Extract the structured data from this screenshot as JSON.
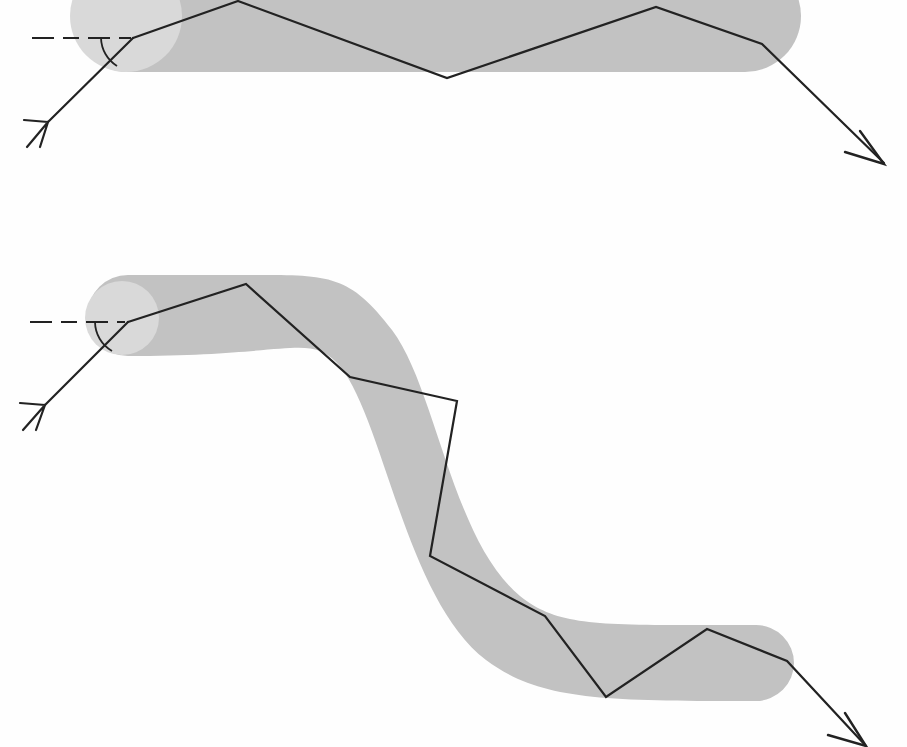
{
  "document": {
    "kind": "technical-diagram",
    "title": "",
    "canvas": {
      "width": 907,
      "height": 747,
      "background": "#fefefe"
    }
  },
  "style": {
    "band_fill": "#c2c2c2",
    "bulb_fill": "#d9d9d9",
    "path_stroke": "#222222",
    "reference_stroke": "#222222",
    "arc_stroke": "#222222",
    "path_stroke_width": 2.2,
    "reference_stroke_width": 2.0,
    "reference_dash": "22 9 16 9 22 9",
    "arc_stroke_width": 1.8
  },
  "figures": [
    {
      "id": "upper-figure",
      "name": "straight-channel-figure",
      "label": "",
      "band": {
        "name": "straight-band",
        "shape": "rounded-straight-band",
        "d": "M 128,-40 L 745,-40 A 56 56 0 0 1 745,72 L 128,72 A 56 56 0 0 1 128,-40 Z",
        "fill": "#c2c2c2"
      },
      "bulb": {
        "name": "entry-bulb",
        "shape": "circle",
        "cx": 126,
        "cy": 16,
        "r": 56,
        "fill": "#d9d9d9"
      },
      "reference_line": {
        "name": "horizontal-reference-line",
        "d": "M 32,38 L 131,38",
        "dash": "22 9 16 9 22 9"
      },
      "angle_arc": {
        "name": "incidence-angle-arc",
        "d": "M 101,38 A 34 34 0 0 0 117,66",
        "note": "arc between reference line and incoming ray"
      },
      "incoming_ray": {
        "name": "incoming-ray",
        "d": "M 48,122 L 133,38",
        "arrow": {
          "name": "tail-arrowhead",
          "style": "open-barb-tail",
          "d": "M 24,120 L 48,122 M 27,147 L 48,122 M 40,147 L 48,122",
          "tip": [
            48,
            122
          ]
        }
      },
      "ray_path": {
        "name": "ray-polyline",
        "points": [
          [
            133,
            38
          ],
          [
            238,
            1
          ],
          [
            447,
            78
          ],
          [
            656,
            7
          ],
          [
            762,
            44
          ],
          [
            884,
            163
          ]
        ],
        "d": "M 133,38 L 238,1 L 447,78 L 656,7 L 762,44 L 884,163"
      },
      "exit_arrow": {
        "name": "exit-arrowhead",
        "style": "closed-v",
        "d": "M 860,131 L 884,164 L 845,152",
        "tip": [
          884,
          164
        ]
      }
    },
    {
      "id": "lower-figure",
      "name": "s-bend-channel-figure",
      "label": "",
      "band": {
        "name": "s-bend-band",
        "shape": "rounded-s-curve-band",
        "d": "M 128,275 L 255,275 C 330,275 350,275 392,330 C 436,388 452,540 520,596 C 560,628 600,625 756,625 A 38 38 0 0 1 756,701 C 600,701 540,700 486,660 C 404,598 382,408 336,362 C 308,334 290,356 128,356 A 40.5 40.5 0 0 1 128,275 Z",
        "fill": "#c2c2c2"
      },
      "bulb": {
        "name": "entry-bulb",
        "shape": "circle",
        "cx": 122,
        "cy": 318,
        "r": 37,
        "fill": "#d9d9d9"
      },
      "reference_line": {
        "name": "horizontal-reference-line",
        "d": "M 30,322 L 125,322",
        "dash": "22 9 16 9 22 9"
      },
      "angle_arc": {
        "name": "incidence-angle-arc",
        "d": "M 95,322 A 34 34 0 0 0 112,351",
        "note": "arc between reference line and incoming ray"
      },
      "incoming_ray": {
        "name": "incoming-ray",
        "d": "M 45,405 L 128,322",
        "arrow": {
          "name": "tail-arrowhead",
          "style": "open-barb-tail",
          "d": "M 20,403 L 45,405 M 23,430 L 45,405 M 36,430 L 45,405",
          "tip": [
            45,
            405
          ]
        }
      },
      "ray_path": {
        "name": "ray-polyline",
        "points": [
          [
            128,
            322
          ],
          [
            246,
            284
          ],
          [
            350,
            377
          ],
          [
            457,
            401
          ],
          [
            430,
            556
          ],
          [
            545,
            616
          ],
          [
            606,
            697
          ],
          [
            707,
            629
          ],
          [
            787,
            661
          ],
          [
            866,
            746
          ]
        ],
        "d": "M 128,322 L 246,284 L 350,377 L 457,401 L 430,556 L 545,616 L 606,697 L 707,629 L 787,661 L 866,746"
      },
      "exit_arrow": {
        "name": "exit-arrowhead",
        "style": "closed-v",
        "d": "M 845,713 L 866,746 L 828,735",
        "tip": [
          866,
          746
        ]
      }
    }
  ],
  "chart_data": {
    "type": "line",
    "title": "",
    "xlabel": "",
    "ylabel": "",
    "series": [
      {
        "name": "upper-ray-path",
        "points": [
          [
            133,
            38
          ],
          [
            238,
            1
          ],
          [
            447,
            78
          ],
          [
            656,
            7
          ],
          [
            762,
            44
          ],
          [
            884,
            163
          ]
        ]
      },
      {
        "name": "lower-ray-path",
        "points": [
          [
            128,
            322
          ],
          [
            246,
            284
          ],
          [
            350,
            377
          ],
          [
            457,
            401
          ],
          [
            430,
            556
          ],
          [
            545,
            616
          ],
          [
            606,
            697
          ],
          [
            707,
            629
          ],
          [
            787,
            661
          ],
          [
            866,
            746
          ]
        ]
      }
    ]
  }
}
